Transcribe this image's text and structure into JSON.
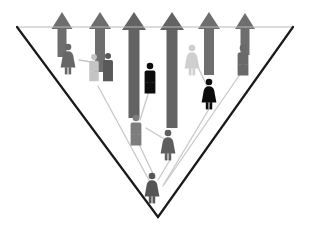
{
  "diagram": {
    "canvas": {
      "width": 311,
      "height": 236,
      "background": "#ffffff"
    },
    "palette": {
      "triangle_stroke_dark": "#1a1a1a",
      "triangle_stroke_light": "#b9b9b9",
      "arrow_gray": "#6e6e6e",
      "arrow_gray_dark": "#636363",
      "figure_black": "#0c0c0c",
      "figure_dark_gray": "#555555",
      "figure_mid_gray": "#7d7d7d",
      "figure_light_gray": "#b5b5b5",
      "figure_pale_gray": "#cfcfcf",
      "link_line": "#c8c8c8"
    },
    "triangle": {
      "name": "inverted-triangle-funnel",
      "top_left": {
        "x": 17,
        "y": 27
      },
      "top_right": {
        "x": 293,
        "y": 27
      },
      "bottom_vertex": {
        "x": 158,
        "y": 217
      },
      "top_edge_stroke": "#b9b9b9",
      "side_edge_stroke": "#1a1a1a",
      "top_edge_width": 1,
      "side_edge_width": 2.2,
      "fill": "none"
    },
    "arrows": [
      {
        "name": "arrow-1",
        "x": 62,
        "tip_y": 12,
        "tail_y": 57,
        "shaft_width": 9,
        "head_width": 21,
        "head_height": 17,
        "color": "#6e6e6e"
      },
      {
        "name": "arrow-2",
        "x": 100,
        "tip_y": 12,
        "tail_y": 72,
        "shaft_width": 10,
        "head_width": 22,
        "head_height": 17,
        "color": "#6e6e6e"
      },
      {
        "name": "arrow-3",
        "x": 134,
        "tip_y": 12,
        "tail_y": 118,
        "shaft_width": 11,
        "head_width": 24,
        "head_height": 18,
        "color": "#636363"
      },
      {
        "name": "arrow-4",
        "x": 172,
        "tip_y": 12,
        "tail_y": 128,
        "shaft_width": 11,
        "head_width": 24,
        "head_height": 18,
        "color": "#636363"
      },
      {
        "name": "arrow-5",
        "x": 209,
        "tip_y": 12,
        "tail_y": 75,
        "shaft_width": 10,
        "head_width": 22,
        "head_height": 17,
        "color": "#6e6e6e"
      },
      {
        "name": "arrow-6",
        "x": 245,
        "tip_y": 13,
        "tail_y": 55,
        "shaft_width": 9,
        "head_width": 20,
        "head_height": 16,
        "color": "#6e6e6e"
      }
    ],
    "figures": [
      {
        "name": "person-female-upper-left",
        "type": "female",
        "x": 68,
        "y": 47,
        "scale": 1.0,
        "color": "#676767"
      },
      {
        "name": "person-male-pale-left",
        "type": "male",
        "x": 94,
        "y": 57,
        "scale": 0.88,
        "color": "#c4c4c4"
      },
      {
        "name": "person-male-dark-left",
        "type": "male",
        "x": 108,
        "y": 56,
        "scale": 0.92,
        "color": "#595959"
      },
      {
        "name": "person-male-black-center",
        "type": "male",
        "x": 150,
        "y": 66,
        "scale": 1.0,
        "color": "#0c0c0c"
      },
      {
        "name": "person-female-pale-right",
        "type": "female",
        "x": 192,
        "y": 48,
        "scale": 1.0,
        "color": "#cfcfcf"
      },
      {
        "name": "person-female-black-right",
        "type": "female",
        "x": 209,
        "y": 82,
        "scale": 1.0,
        "color": "#0c0c0c"
      },
      {
        "name": "person-male-far-right",
        "type": "male",
        "x": 243,
        "y": 48,
        "scale": 1.0,
        "color": "#6a6a6a"
      },
      {
        "name": "person-male-mid-lower",
        "type": "male",
        "x": 136,
        "y": 118,
        "scale": 1.0,
        "color": "#7d7d7d"
      },
      {
        "name": "person-female-mid-lower",
        "type": "female",
        "x": 168,
        "y": 133,
        "scale": 1.0,
        "color": "#5e5e5e"
      },
      {
        "name": "person-female-bottom",
        "type": "female",
        "x": 152,
        "y": 176,
        "scale": 1.0,
        "color": "#555555"
      }
    ],
    "links": [
      {
        "name": "link-upper-left-pair",
        "x1": 79,
        "y1": 60,
        "x2": 92,
        "y2": 62
      },
      {
        "name": "link-pale-right-black",
        "x1": 197,
        "y1": 65,
        "x2": 208,
        "y2": 88
      },
      {
        "name": "link-center-to-mid",
        "x1": 150,
        "y1": 88,
        "x2": 140,
        "y2": 120
      },
      {
        "name": "link-mid-male-female",
        "x1": 146,
        "y1": 128,
        "x2": 166,
        "y2": 140
      },
      {
        "name": "link-mid-female-bottom",
        "x1": 170,
        "y1": 160,
        "x2": 158,
        "y2": 180
      },
      {
        "name": "link-mid-male-bottom",
        "x1": 138,
        "y1": 142,
        "x2": 155,
        "y2": 178
      },
      {
        "name": "link-left-long-bottom",
        "x1": 98,
        "y1": 86,
        "x2": 150,
        "y2": 182
      },
      {
        "name": "link-right-long-bottom",
        "x1": 243,
        "y1": 70,
        "x2": 163,
        "y2": 186
      },
      {
        "name": "link-right-black-bottom",
        "x1": 212,
        "y1": 104,
        "x2": 164,
        "y2": 184
      }
    ]
  }
}
